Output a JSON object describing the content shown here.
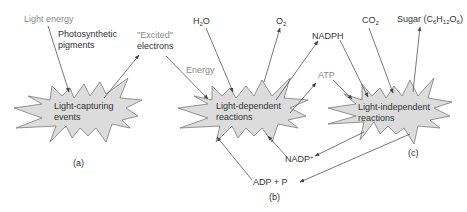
{
  "colors": {
    "burst_fill": "#dcdcdc",
    "burst_stroke": "#7a7a7a",
    "text_dark": "#333333",
    "text_light": "#8a8a8a",
    "arrow": "#555555"
  },
  "panel_a": {
    "caption": "(a)",
    "burst_label_line1": "Light-capturing",
    "burst_label_line2": "events",
    "inputs": {
      "light_energy": "Light energy",
      "pigments_line1": "Photosynthetic",
      "pigments_line2": "pigments"
    },
    "outputs": {
      "excited_line1": "\"Excited\"",
      "excited_line2": "electrons"
    }
  },
  "panel_b": {
    "caption": "(b)",
    "burst_label_line1": "Light-dependent",
    "burst_label_line2": "reactions",
    "inputs": {
      "water": "H",
      "water_sub": "2",
      "water_tail": "O",
      "energy": "Energy",
      "nadp": "NADP",
      "nadp_sup": "+",
      "adp": "ADP + P"
    },
    "outputs": {
      "oxygen": "O",
      "oxygen_sub": "2",
      "nadph": "NADPH",
      "atp": "ATP"
    }
  },
  "panel_c": {
    "caption": "(c)",
    "burst_label_line1": "Light-independent",
    "burst_label_line2": "reactions",
    "inputs": {
      "co2": "CO",
      "co2_sub": "2"
    },
    "outputs": {
      "sugar_prefix": "Sugar (C",
      "sugar_c_sub": "6",
      "sugar_h": "H",
      "sugar_h_sub": "12",
      "sugar_o": "O",
      "sugar_o_sub": "6",
      "sugar_suffix": ")"
    }
  }
}
